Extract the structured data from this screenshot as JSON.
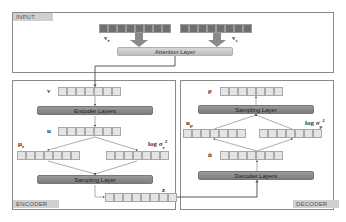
{
  "input": {
    "tag": "INPUT",
    "left_vector_label": "v_r",
    "right_vector_label": "v_s",
    "attention_layer": "Attention Layer",
    "vector_cells": 8
  },
  "encoder": {
    "tag": "ENCODER",
    "v_label": "v",
    "encoder_layers": "Encoder Layers",
    "u_label": "u",
    "mu_label": "μ_r",
    "logvar_label": "log σ_r²",
    "sampling_layer": "Sampling Layer",
    "z_label": "z",
    "vector_cells": 7
  },
  "decoder": {
    "tag": "DECODER",
    "rho_label": "ρ",
    "sampling_layer": "Sampling Layer",
    "mu_label": "u_p",
    "logvar_label": "log σ_p²",
    "u_hat_label": "û",
    "decoder_layers": "Decoder Layers",
    "vector_cells": 7
  },
  "colors": {
    "border": "#8a8a8a",
    "tag_bg": "#cfcfcf",
    "light_layer": "#c8c8c8",
    "dark_layer": "#8a8a8a",
    "input_cells": "#6f6f6f",
    "cells": "#e4e4e4"
  }
}
